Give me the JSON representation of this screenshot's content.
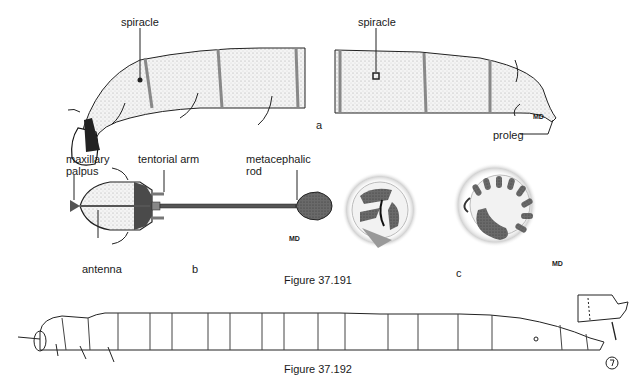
{
  "figure_37_191": {
    "caption": "Figure 37.191",
    "panel_a": {
      "letter": "a",
      "labels": {
        "spiracle_left": "spiracle",
        "spiracle_right": "spiracle",
        "proleg": "proleg",
        "md": "MD"
      }
    },
    "panel_b": {
      "letter": "b",
      "labels": {
        "maxillary_palpus_line1": "maxillary",
        "maxillary_palpus_line2": "palpus",
        "tentorial_arm": "tentorial arm",
        "metacephalic_line1": "metacephalic",
        "metacephalic_line2": "rod",
        "antenna": "antenna",
        "md": "MD"
      }
    },
    "panel_c": {
      "letter": "c",
      "labels": {
        "md": "MD"
      }
    }
  },
  "figure_37_192": {
    "caption": "Figure 37.192"
  },
  "colors": {
    "ink": "#1a1a1a",
    "stipple": "#bdbdbd",
    "dark_fill": "#555555",
    "paper": "#ffffff"
  }
}
